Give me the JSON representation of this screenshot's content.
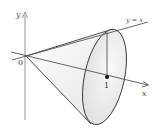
{
  "diagram": {
    "type": "solid-of-revolution",
    "labels": {
      "y_axis": "y",
      "x_axis": "x",
      "origin": "0",
      "line": "y = x",
      "tick": "1"
    },
    "colors": {
      "stroke": "#333333",
      "axis": "#777777",
      "fill_light": "#f4f4f4",
      "fill_shade": "#dcdcdc"
    }
  }
}
